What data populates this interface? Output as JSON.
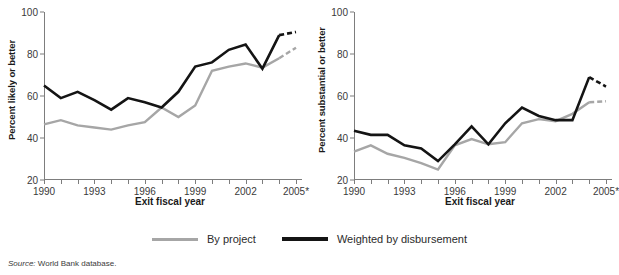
{
  "figure": {
    "source_prefix": "Source:",
    "source_text": " World Bank database."
  },
  "legend": {
    "position": "bottom-center",
    "items": [
      {
        "label": "By project",
        "color": "#a6a6a6",
        "style": "solid"
      },
      {
        "label": "Weighted by disbursement",
        "color": "#141414",
        "style": "solid"
      }
    ]
  },
  "chart_data": [
    {
      "type": "line",
      "panel": "left",
      "title": "",
      "xlabel": "Exit fiscal year",
      "ylabel": "Percent likely or better",
      "xlim": [
        1990,
        2005
      ],
      "ylim": [
        20,
        100
      ],
      "yticks": [
        20,
        40,
        60,
        80,
        100
      ],
      "ytick_labels": [
        "20",
        "40",
        "60",
        "80",
        "100"
      ],
      "x": [
        1990,
        1991,
        1992,
        1993,
        1994,
        1995,
        1996,
        1997,
        1998,
        1999,
        2000,
        2001,
        2002,
        2003,
        2004,
        2005
      ],
      "xtick_labels": [
        "1990",
        "",
        "",
        "1993",
        "",
        "",
        "1996",
        "",
        "",
        "1999",
        "",
        "",
        "2002",
        "",
        "",
        "2005*"
      ],
      "grid": false,
      "dashed_last_segment": true,
      "series": [
        {
          "name": "By project",
          "color": "#a6a6a6",
          "values": [
            46.5,
            48.5,
            46.0,
            45.0,
            44.0,
            46.0,
            47.5,
            54.5,
            50.0,
            55.5,
            72.0,
            74.0,
            75.5,
            73.5,
            78.0,
            83.0
          ]
        },
        {
          "name": "Weighted by disbursement",
          "color": "#141414",
          "values": [
            65.0,
            59.0,
            62.0,
            58.0,
            53.5,
            59.0,
            57.0,
            54.5,
            62.0,
            74.0,
            76.0,
            82.0,
            84.5,
            73.0,
            89.0,
            90.5
          ]
        }
      ]
    },
    {
      "type": "line",
      "panel": "right",
      "title": "",
      "xlabel": "Exit fiscal year",
      "ylabel": "Percent substantial or better",
      "xlim": [
        1990,
        2005
      ],
      "ylim": [
        20,
        100
      ],
      "yticks": [
        20,
        40,
        60,
        80,
        100
      ],
      "ytick_labels": [
        "20",
        "40",
        "60",
        "80",
        "100"
      ],
      "x": [
        1990,
        1991,
        1992,
        1993,
        1994,
        1995,
        1996,
        1997,
        1998,
        1999,
        2000,
        2001,
        2002,
        2003,
        2004,
        2005
      ],
      "xtick_labels": [
        "1990",
        "",
        "",
        "1993",
        "",
        "",
        "1996",
        "",
        "",
        "1999",
        "",
        "",
        "2002",
        "",
        "",
        "2005*"
      ],
      "grid": false,
      "dashed_last_segment": true,
      "series": [
        {
          "name": "By project",
          "color": "#a6a6a6",
          "values": [
            33.5,
            36.5,
            32.5,
            30.5,
            28.0,
            25.0,
            36.5,
            39.5,
            37.0,
            38.0,
            47.0,
            49.0,
            48.0,
            51.5,
            57.0,
            57.5
          ]
        },
        {
          "name": "Weighted by disbursement",
          "color": "#141414",
          "values": [
            43.5,
            41.5,
            41.5,
            36.5,
            35.0,
            29.0,
            37.0,
            45.5,
            37.0,
            47.0,
            54.5,
            50.5,
            48.5,
            48.5,
            69.0,
            64.5
          ]
        }
      ]
    }
  ]
}
